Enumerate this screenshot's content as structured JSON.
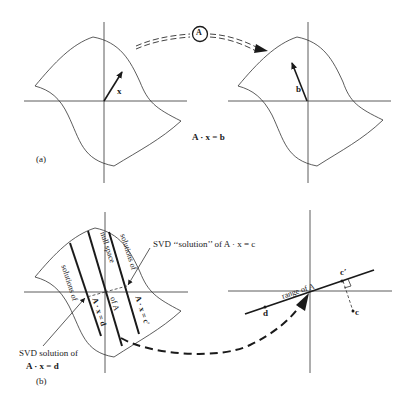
{
  "figure": {
    "panel_a": {
      "label": "(a)",
      "domain_vector": "x",
      "range_vector": "b",
      "equation": "A · x = b",
      "map_operator": "A"
    },
    "panel_b": {
      "label": "(b)",
      "band_labels": {
        "solutions_d_top": "solutions of",
        "solutions_d_bottom": "A · x = d",
        "null_space_top": "null space",
        "null_space_bottom": "of A",
        "solutions_c_top": "solutions of",
        "solutions_c_bottom": "A · x = c′"
      },
      "svd_solution_c": "SVD ‘‘solution’’ of A · x = c",
      "svd_solution_d_line1": "SVD solution of",
      "svd_solution_d_line2": "A · x = d",
      "range_label": "range of A",
      "point_d": "d",
      "point_c_prime": "c′",
      "point_c": "c"
    },
    "colors": {
      "ink": "#1a1a1a",
      "background": "#ffffff"
    }
  }
}
